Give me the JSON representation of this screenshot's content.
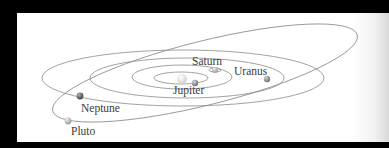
{
  "diagram": {
    "title": "",
    "background_color": "#ffffff",
    "orbit_color": "#8a8a8a",
    "sun": {
      "name": "Sun",
      "color": "#e8e8e8"
    },
    "planets": [
      {
        "name": "Jupiter",
        "label": "Jupiter",
        "color": "#8d8d8d"
      },
      {
        "name": "Saturn",
        "label": "Saturn",
        "color": "#9a9a9a"
      },
      {
        "name": "Uranus",
        "label": "Uranus",
        "color": "#7b7b7b"
      },
      {
        "name": "Neptune",
        "label": "Neptune",
        "color": "#555555"
      },
      {
        "name": "Pluto",
        "label": "Pluto",
        "color": "#b5b5b5"
      }
    ]
  }
}
